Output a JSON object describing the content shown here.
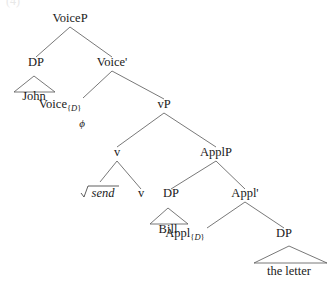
{
  "figure": {
    "type": "syntax-tree",
    "example_number": "(4)",
    "root": "VoiceP"
  },
  "nodes": {
    "voiceP": {
      "label": "VoiceP",
      "x": 70,
      "y": 22
    },
    "dp_subject": {
      "label": "DP",
      "x": 36,
      "y": 66
    },
    "voice_bar": {
      "label": "Voice'",
      "x": 112,
      "y": 66
    },
    "john": {
      "label": "John",
      "x": 34,
      "y": 100
    },
    "voice_head": {
      "label": "Voice",
      "sub": "{D}",
      "x": 80,
      "y": 108
    },
    "phi": {
      "label": "ϕ",
      "x": 82,
      "y": 125
    },
    "vP": {
      "label": "vP",
      "x": 164,
      "y": 108
    },
    "v_node": {
      "label": "v",
      "x": 117,
      "y": 156
    },
    "applP": {
      "label": "ApplP",
      "x": 216,
      "y": 156
    },
    "root_send": {
      "label": "send",
      "radical": "√",
      "x": 100,
      "y": 197
    },
    "v_leaf": {
      "label": "v",
      "x": 141,
      "y": 197
    },
    "dp_bill": {
      "label": "DP",
      "x": 171,
      "y": 197
    },
    "appl_bar": {
      "label": "Appl'",
      "x": 245,
      "y": 197
    },
    "bill": {
      "label": "Bill",
      "x": 168,
      "y": 233
    },
    "appl_head": {
      "label": "Appl",
      "sub": "{D}",
      "x": 204,
      "y": 237
    },
    "dp_letter": {
      "label": "DP",
      "x": 284,
      "y": 237
    },
    "the_letter": {
      "label": "the letter",
      "x": 289,
      "y": 272
    }
  },
  "labels": {
    "voiceP": "VoiceP",
    "dp_subject": "DP",
    "voice_bar": "Voice'",
    "john": "John",
    "voice_head": "Voice",
    "voice_head_sub_open": "{",
    "voice_head_sub_d": "D",
    "voice_head_sub_close": "}",
    "phi": "ϕ",
    "vP": "vP",
    "v_node": "v",
    "applP": "ApplP",
    "root_send": "send",
    "v_leaf": "v",
    "dp_bill": "DP",
    "appl_bar": "Appl'",
    "bill": "Bill",
    "appl_head": "Appl",
    "appl_head_sub_open": "{",
    "appl_head_sub_d": "D",
    "appl_head_sub_close": "}",
    "dp_letter": "DP",
    "the_letter": "the letter"
  },
  "colors": {
    "background": "#ffffff",
    "text": "#1a1a1a",
    "branch": "#555555"
  }
}
